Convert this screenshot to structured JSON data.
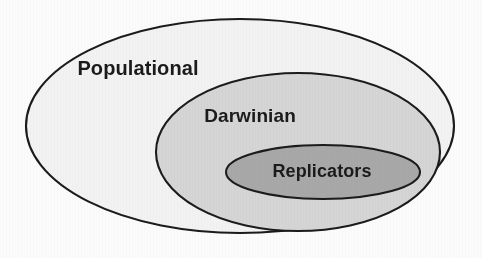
{
  "figure": {
    "type": "nested-set-diagram",
    "background_color": "#fbfbfb",
    "stroke_color": "#1b1b1b",
    "sets": [
      {
        "id": "populational",
        "label": "Populational",
        "level": 1,
        "fill_color": "#f2f2f2",
        "cx": 240,
        "cy": 126,
        "rx": 214,
        "ry": 107,
        "label_x": 138,
        "label_y": 70
      },
      {
        "id": "darwinian",
        "label": "Darwinian",
        "level": 2,
        "fill_color": "#d5d5d5",
        "cx": 298,
        "cy": 152,
        "rx": 142,
        "ry": 79,
        "label_x": 250,
        "label_y": 117
      },
      {
        "id": "replicators",
        "label": "Replicators",
        "level": 3,
        "fill_color": "#a8a8a8",
        "cx": 323,
        "cy": 172,
        "rx": 97,
        "ry": 27,
        "label_x": 322,
        "label_y": 172
      }
    ]
  }
}
